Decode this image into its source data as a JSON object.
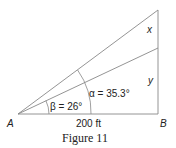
{
  "figure": {
    "caption": "Figure 11",
    "points": {
      "A": "A",
      "B": "B"
    },
    "labels": {
      "x": "x",
      "y": "y",
      "base": "200 ft",
      "alpha": "α = 35.3°",
      "beta": "β = 26°"
    },
    "colors": {
      "line": "#888888",
      "text": "#222222"
    }
  }
}
